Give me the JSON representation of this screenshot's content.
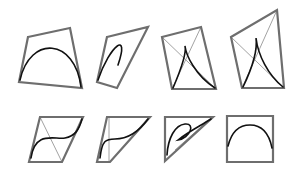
{
  "figure": {
    "background": "#ffffff",
    "colors": {
      "polygon": "#6e6e6e",
      "diagonal": "#8a8a8a",
      "curve": "#111111"
    }
  },
  "panels": [
    {
      "id": "arch-wide",
      "polygon": "28,37 70,28 82,88 19,82",
      "diagonals": [],
      "curve": "M20,80 C30,35 75,38 81,87"
    },
    {
      "id": "arch-narrow",
      "polygon": "107,37 148,27 117,88 97,82",
      "diagonals": [],
      "curve": "M98,80 C110,45 130,30 118,65"
    },
    {
      "id": "cusp-left",
      "polygon": "162,37 201,27 216,89 172,89",
      "diagonals": [
        "162,37 216,89",
        "201,27 172,89"
      ],
      "curve": "M173,88 C185,60 186,50 185,46 C186,55 195,75 215,88"
    },
    {
      "id": "cusp-right",
      "polygon": "231,37 277,10 284,88 242,88",
      "diagonals": [
        "231,37 284,88",
        "277,10 242,88"
      ],
      "curve": "M243,87 C256,60 257,45 256,38 C258,55 268,75 283,87"
    },
    {
      "id": "inflection-s",
      "polygon": "40,117 83,117 62,162 29,162",
      "diagonals": [
        "40,117 62,162"
      ],
      "curve": "M31,158 C35,130 55,140 65,138 C75,136 79,130 82,119"
    },
    {
      "id": "inflection-flat",
      "polygon": "107,117 150,117 110,162 97,162",
      "diagonals": [
        "109,117 109,162"
      ],
      "curve": "M100,158 C102,140 106,139 115,139 C130,139 140,130 148,119"
    },
    {
      "id": "loop",
      "polygon": "165,117 213,117 165,161",
      "diagonals": [
        "175,150 210,119"
      ],
      "curve": "M167,155 C168,138 175,125 185,124 C196,123 190,138 178,140 C188,132 200,126 211,119"
    },
    {
      "id": "arch-square",
      "polygon": "227,116 273,116 273,162 227,162",
      "diagonals": [],
      "curve": "M228,146 C232,130 241,125 250,125 C262,125 269,133 272,148"
    }
  ]
}
